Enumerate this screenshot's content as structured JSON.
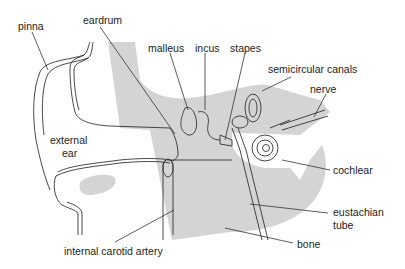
{
  "diagram": {
    "colors": {
      "shade": "#d4d4d4",
      "line": "#333333",
      "background": "#ffffff"
    },
    "labels": {
      "pinna": "pinna",
      "eardrum": "eardrum",
      "malleus": "malleus",
      "incus": "incus",
      "stapes": "stapes",
      "semicircular_canals": "semicircular canals",
      "nerve": "nerve",
      "external_ear_1": "external",
      "external_ear_2": "ear",
      "cochlear": "cochlear",
      "eustachian_1": "eustachian",
      "eustachian_2": "tube",
      "bone": "bone",
      "carotid": "internal carotid artery"
    }
  }
}
